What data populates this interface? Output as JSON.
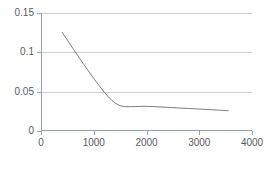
{
  "chart_data": {
    "type": "line",
    "title": "",
    "subtitle": "",
    "xlabel": "",
    "ylabel": "",
    "xlim": [
      0,
      4000
    ],
    "ylim": [
      0,
      0.15
    ],
    "grid": "horizontal",
    "legend": "none",
    "xticks": [
      0,
      1000,
      2000,
      3000,
      4000
    ],
    "xtick_labels": [
      "0",
      "1000",
      "2000",
      "3000",
      "4000"
    ],
    "yticks": [
      0,
      0.05,
      0.1,
      0.15
    ],
    "ytick_labels": [
      "0",
      "0.05",
      "0.1",
      "0.15"
    ],
    "series": [
      {
        "name": "series-1",
        "color": "#6e6e6e",
        "x": [
          400,
          500,
          600,
          700,
          800,
          900,
          1000,
          1100,
          1200,
          1300,
          1400,
          1500,
          1600,
          1700,
          1800,
          1900,
          2000,
          2200,
          2400,
          2600,
          2800,
          3000,
          3200,
          3400,
          3550
        ],
        "values": [
          0.1253,
          0.1155,
          0.1055,
          0.0955,
          0.0858,
          0.0762,
          0.0668,
          0.0578,
          0.0492,
          0.0416,
          0.0357,
          0.0321,
          0.0309,
          0.0309,
          0.031,
          0.0313,
          0.0313,
          0.0308,
          0.0301,
          0.0293,
          0.0286,
          0.0279,
          0.0272,
          0.0264,
          0.0258
        ]
      }
    ]
  },
  "axes": {
    "x_axis_color": "#9aa0a8",
    "y_axis_color": "#9aa0a8",
    "gridline_color": "#c8cdd4",
    "tick_label_color": "#59595b",
    "background_color": "#ffffff"
  }
}
